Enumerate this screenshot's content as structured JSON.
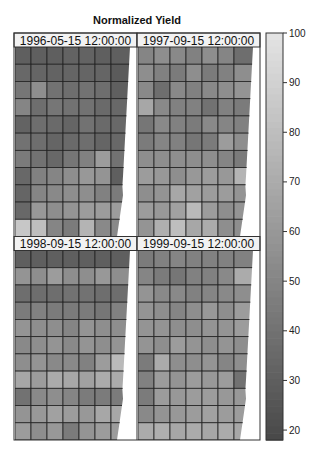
{
  "chart_data": {
    "type": "heatmap",
    "title": "Normalized Yield",
    "xlabel": "",
    "ylabel": "",
    "colorbar": {
      "range": [
        18,
        100
      ],
      "ticks": [
        20,
        30,
        40,
        50,
        60,
        70,
        80,
        90,
        100
      ],
      "tick_labels": [
        "20",
        "30",
        "40",
        "50",
        "60",
        "70",
        "80",
        "90",
        "100"
      ],
      "colormap": "grayscale (dark = low, light = high)"
    },
    "grid": {
      "columns": 7,
      "rows": 11
    },
    "panels": [
      {
        "label": "1996-05-15 12:00:00",
        "values": [
          [
            30,
            30,
            30,
            32,
            32,
            30,
            30
          ],
          [
            35,
            33,
            32,
            33,
            33,
            33,
            28
          ],
          [
            42,
            55,
            40,
            38,
            40,
            38,
            30
          ],
          [
            50,
            38,
            42,
            40,
            40,
            36,
            35
          ],
          [
            32,
            38,
            36,
            33,
            40,
            36,
            35
          ],
          [
            40,
            38,
            33,
            36,
            38,
            33,
            35
          ],
          [
            45,
            40,
            35,
            42,
            48,
            62,
            40
          ],
          [
            35,
            48,
            50,
            55,
            60,
            58,
            30
          ],
          [
            33,
            50,
            52,
            55,
            55,
            48,
            45
          ],
          [
            35,
            60,
            55,
            58,
            62,
            62,
            62
          ],
          [
            85,
            80,
            50,
            45,
            75,
            52,
            52
          ]
        ]
      },
      {
        "label": "1997-09-15 12:00:00",
        "values": [
          [
            50,
            55,
            52,
            48,
            55,
            50,
            38
          ],
          [
            55,
            48,
            45,
            55,
            45,
            48,
            55
          ],
          [
            52,
            38,
            52,
            48,
            52,
            55,
            58
          ],
          [
            68,
            52,
            48,
            48,
            40,
            48,
            45
          ],
          [
            42,
            52,
            48,
            45,
            52,
            50,
            48
          ],
          [
            45,
            50,
            48,
            42,
            45,
            62,
            55
          ],
          [
            55,
            55,
            55,
            55,
            55,
            50,
            45
          ],
          [
            62,
            60,
            55,
            60,
            62,
            60,
            75
          ],
          [
            55,
            58,
            68,
            65,
            62,
            62,
            58
          ],
          [
            62,
            60,
            65,
            78,
            62,
            55,
            58
          ],
          [
            58,
            72,
            80,
            68,
            70,
            55,
            55
          ]
        ]
      },
      {
        "label": "1998-09-15 12:00:00",
        "values": [
          [
            30,
            30,
            30,
            30,
            30,
            30,
            30
          ],
          [
            58,
            55,
            62,
            55,
            55,
            60,
            55
          ],
          [
            38,
            38,
            38,
            40,
            40,
            38,
            38
          ],
          [
            45,
            48,
            45,
            45,
            45,
            42,
            48
          ],
          [
            58,
            55,
            55,
            50,
            58,
            55,
            55
          ],
          [
            52,
            55,
            58,
            52,
            58,
            55,
            58
          ],
          [
            55,
            58,
            52,
            52,
            48,
            62,
            78
          ],
          [
            68,
            62,
            70,
            68,
            65,
            70,
            70
          ],
          [
            40,
            52,
            55,
            50,
            45,
            45,
            45
          ],
          [
            58,
            60,
            65,
            62,
            60,
            68,
            68
          ],
          [
            62,
            55,
            60,
            45,
            58,
            62,
            62
          ]
        ]
      },
      {
        "label": "1999-09-15 12:00:00",
        "values": [
          [
            45,
            48,
            50,
            48,
            48,
            48,
            48
          ],
          [
            50,
            45,
            42,
            48,
            48,
            52,
            70
          ],
          [
            58,
            52,
            52,
            48,
            50,
            52,
            55
          ],
          [
            58,
            55,
            50,
            55,
            60,
            55,
            62
          ],
          [
            58,
            58,
            55,
            55,
            58,
            58,
            62
          ],
          [
            58,
            55,
            62,
            58,
            55,
            58,
            55
          ],
          [
            45,
            70,
            55,
            55,
            58,
            50,
            55
          ],
          [
            48,
            62,
            58,
            62,
            60,
            62,
            40
          ],
          [
            45,
            62,
            60,
            62,
            62,
            60,
            60
          ],
          [
            52,
            58,
            60,
            62,
            65,
            62,
            62
          ],
          [
            70,
            72,
            68,
            70,
            68,
            70,
            68
          ]
        ]
      }
    ]
  }
}
